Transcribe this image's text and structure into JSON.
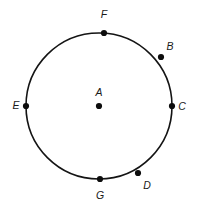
{
  "figure": {
    "type": "circle-with-labeled-points",
    "background_color": "#ffffff",
    "stroke_color": "#141414",
    "dot_color": "#0d0d0d",
    "label_color": "#1a1a1a",
    "circle": {
      "center_x": 99,
      "center_y": 106,
      "radius": 73,
      "center_point_label": "A"
    },
    "points": [
      {
        "label": "A",
        "role": "center",
        "x": 99,
        "y": 106,
        "label_x": 99,
        "label_y": 93,
        "label_anchor": "middle"
      },
      {
        "label": "B",
        "role": "on-circle",
        "x": 161,
        "y": 57,
        "label_x": 170,
        "label_y": 47,
        "label_anchor": "middle"
      },
      {
        "label": "C",
        "role": "on-circle",
        "x": 172,
        "y": 106,
        "label_x": 182,
        "label_y": 107,
        "label_anchor": "middle"
      },
      {
        "label": "D",
        "role": "on-circle",
        "x": 138,
        "y": 173,
        "label_x": 147,
        "label_y": 186,
        "label_anchor": "middle"
      },
      {
        "label": "E",
        "role": "on-circle",
        "x": 26,
        "y": 106,
        "label_x": 16,
        "label_y": 106,
        "label_anchor": "middle"
      },
      {
        "label": "F",
        "role": "on-circle",
        "x": 104,
        "y": 33,
        "label_x": 104,
        "label_y": 15,
        "label_anchor": "middle"
      },
      {
        "label": "G",
        "role": "on-circle",
        "x": 100,
        "y": 179,
        "label_x": 100,
        "label_y": 196,
        "label_anchor": "middle"
      }
    ]
  }
}
